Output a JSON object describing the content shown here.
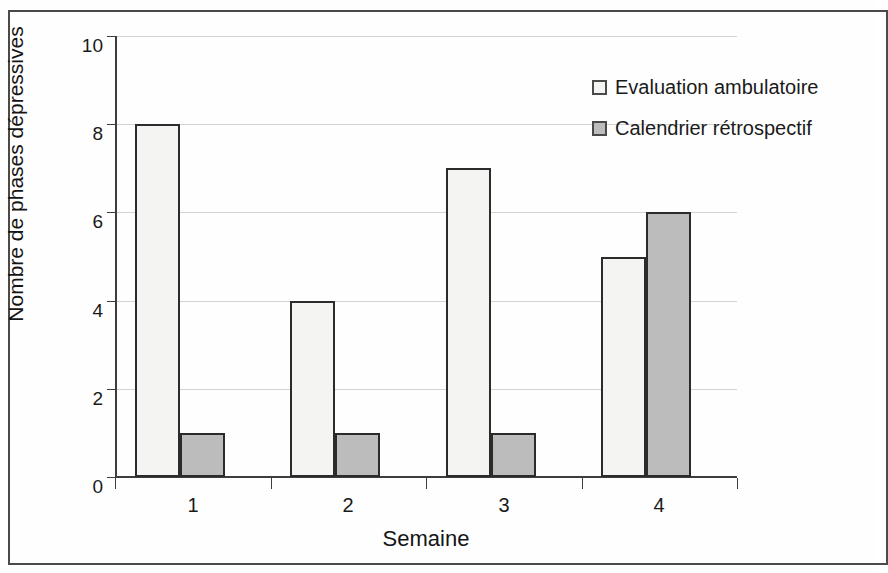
{
  "chart_data": {
    "type": "bar",
    "title": "",
    "subtitle": "",
    "xlabel": "Semaine",
    "ylabel": "Nombre de phases dépressives",
    "categories": [
      "1",
      "2",
      "3",
      "4"
    ],
    "series": [
      {
        "name": "Evaluation ambulatoire",
        "values": [
          8,
          4,
          7,
          5
        ],
        "color": "#f4f4f2"
      },
      {
        "name": "Calendrier rétrospectif",
        "values": [
          1,
          1,
          1,
          6
        ],
        "color": "#bcbcbc"
      }
    ],
    "ylim": [
      0,
      10
    ],
    "yticks": [
      0,
      2,
      4,
      6,
      8,
      10
    ],
    "ytick_labels": [
      "0",
      "2",
      "4",
      "6",
      "8",
      "10"
    ],
    "grid": "horizontal",
    "legend_position": "top-right",
    "bar_border_color": "#2b2b2b",
    "gridline_color": "#d3d3d3",
    "axis_color": "#3d3d3d"
  }
}
